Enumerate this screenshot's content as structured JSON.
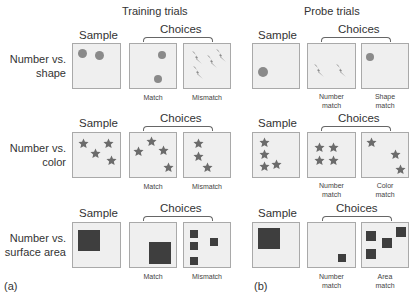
{
  "figure": {
    "colors": {
      "panel_bg": "#efefef",
      "panel_border": "#a9a9a9",
      "circle": "#8a8a8a",
      "bolt": "#8a8a8a",
      "star": "#6b6b6b",
      "square": "#3e3e3e"
    },
    "training": {
      "title": "Training trials",
      "panel_label": "(a)"
    },
    "probe": {
      "title": "Probe trials",
      "panel_label": "(b)"
    },
    "rows": [
      {
        "label_line1": "Number vs.",
        "label_line2": "shape",
        "sample_header": "Sample",
        "choices_header": "Choices",
        "training_sample": {
          "shape": "circle",
          "count": 2
        },
        "training_match": {
          "caption": "Match",
          "shape": "circle",
          "count": 2
        },
        "training_mismatch": {
          "caption": "Mismatch",
          "shape": "lightning-bolt",
          "count": 4
        },
        "probe_sample": {
          "shape": "circle",
          "count": 1
        },
        "probe_choice1": {
          "caption_line1": "Number",
          "caption_line2": "match",
          "shape": "lightning-bolt",
          "count": 2
        },
        "probe_choice2": {
          "caption_line1": "Shape",
          "caption_line2": "match",
          "shape": "circle",
          "count": 1
        }
      },
      {
        "label_line1": "Number vs.",
        "label_line2": "color",
        "sample_header": "Sample",
        "choices_header": "Choices",
        "training_sample": {
          "shape": "star",
          "count": 4
        },
        "training_match": {
          "caption": "Match",
          "shape": "star",
          "count": 4
        },
        "training_mismatch": {
          "caption": "Mismatch",
          "shape": "star",
          "count": 3
        },
        "probe_sample": {
          "shape": "star",
          "count": 4
        },
        "probe_choice1": {
          "caption_line1": "Number",
          "caption_line2": "match",
          "shape": "star",
          "count": 4
        },
        "probe_choice2": {
          "caption_line1": "Color",
          "caption_line2": "match",
          "shape": "star",
          "count": 3
        }
      },
      {
        "label_line1": "Number vs.",
        "label_line2": "surface area",
        "sample_header": "Sample",
        "choices_header": "Choices",
        "training_sample": {
          "shape": "square",
          "count": 1
        },
        "training_match": {
          "caption": "Match",
          "shape": "square",
          "count": 1
        },
        "training_mismatch": {
          "caption": "Mismatch",
          "shape": "square",
          "count": 4
        },
        "probe_sample": {
          "shape": "square",
          "count": 1
        },
        "probe_choice1": {
          "caption_line1": "Number",
          "caption_line2": "match",
          "shape": "square",
          "count": 1
        },
        "probe_choice2": {
          "caption_line1": "Area",
          "caption_line2": "match",
          "shape": "square",
          "count": 4
        }
      }
    ]
  }
}
